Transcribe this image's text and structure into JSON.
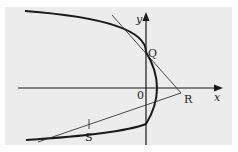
{
  "diagram": {
    "type": "parabola-with-tangents",
    "labels": {
      "x_axis": "x",
      "y_axis": "y",
      "origin": "0",
      "point_q": "Q",
      "point_r": "R",
      "point_s": "S"
    },
    "colors": {
      "background": "#ececec",
      "curve": "#1a1a1a",
      "axes": "#1a1a1a",
      "tangent": "#333333"
    }
  }
}
